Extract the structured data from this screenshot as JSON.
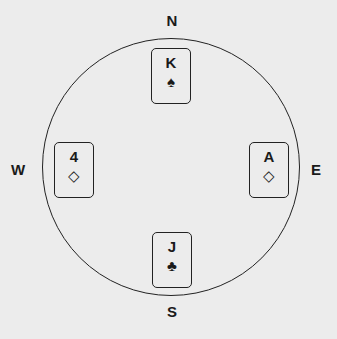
{
  "directions": {
    "north": "N",
    "south": "S",
    "east": "E",
    "west": "W"
  },
  "cards": {
    "north": {
      "rank": "K",
      "suit": "♠",
      "suit_name": "spades"
    },
    "west": {
      "rank": "4",
      "suit": "◇",
      "suit_name": "diamonds"
    },
    "east": {
      "rank": "A",
      "suit": "◇",
      "suit_name": "diamonds"
    },
    "south": {
      "rank": "J",
      "suit": "♣",
      "suit_name": "clubs"
    }
  }
}
